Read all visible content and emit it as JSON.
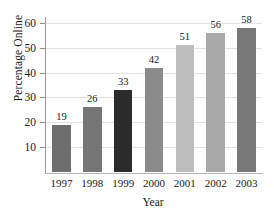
{
  "chart_data": {
    "type": "bar",
    "title": "",
    "xlabel": "Year",
    "ylabel": "Percentage Online",
    "categories": [
      "1997",
      "1998",
      "1999",
      "2000",
      "2001",
      "2002",
      "2003"
    ],
    "values": [
      19,
      26,
      33,
      42,
      51,
      56,
      58
    ],
    "value_labels": [
      "19",
      "26",
      "33",
      "42",
      "51",
      "56",
      "58"
    ],
    "bar_colors": [
      "#6e6e6e",
      "#767676",
      "#2b2b2b",
      "#8b8b8b",
      "#bdbdbd",
      "#a9a9a9",
      "#787878"
    ],
    "ylim": [
      0,
      62
    ],
    "yticks": [
      10,
      20,
      30,
      40,
      50,
      60
    ],
    "ytick_labels": [
      "10",
      "20",
      "30",
      "40",
      "50",
      "60"
    ],
    "grid": true,
    "grid_color": "#e2e2e2",
    "legend": null,
    "axis_color": "#9a9a9a",
    "background": "#fefefe"
  }
}
